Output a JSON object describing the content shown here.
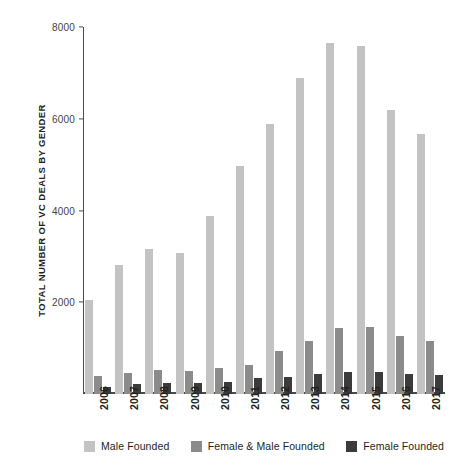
{
  "chart_data": {
    "type": "bar",
    "title": "",
    "xlabel": "",
    "ylabel": "TOTAL NUMBER OF VC DEALS BY GENDER",
    "ylim": [
      0,
      8000
    ],
    "yticks": [
      2000,
      4000,
      6000,
      8000
    ],
    "ytick_labels": [
      "2000",
      "4000",
      "6000",
      "8000"
    ],
    "grid": false,
    "legend_position": "bottom",
    "categories": [
      "2006",
      "2007",
      "2008",
      "2009",
      "2010",
      "2011",
      "2012",
      "2013",
      "2014",
      "2015",
      "2016",
      "2017"
    ],
    "series": [
      {
        "name": "Male Founded",
        "color": "#c3c3c3",
        "values": [
          2060,
          2810,
          3170,
          3070,
          3880,
          4960,
          5880,
          6890,
          7650,
          7590,
          6200,
          5660
        ]
      },
      {
        "name": "Female & Male Founded",
        "color": "#8b8b8b",
        "values": [
          390,
          450,
          530,
          500,
          560,
          640,
          930,
          1160,
          1440,
          1470,
          1270,
          1150
        ]
      },
      {
        "name": "Female Founded",
        "color": "#3b3b3b",
        "values": [
          160,
          210,
          250,
          230,
          260,
          340,
          370,
          430,
          480,
          470,
          440,
          420
        ]
      }
    ]
  },
  "legend": {
    "items": [
      {
        "label": "Male Founded",
        "color": "#c3c3c3"
      },
      {
        "label": "Female & Male Founded",
        "color": "#8b8b8b"
      },
      {
        "label": "Female Founded",
        "color": "#3b3b3b"
      }
    ]
  }
}
